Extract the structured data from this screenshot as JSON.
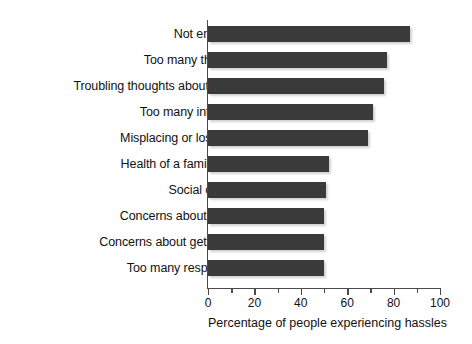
{
  "chart_data": {
    "type": "bar",
    "orientation": "horizontal",
    "title": "",
    "xlabel": "Percentage of people experiencing hassles",
    "ylabel": "",
    "xlim": [
      0,
      100
    ],
    "xticks": [
      0,
      20,
      40,
      60,
      80,
      100
    ],
    "xtick_labels": [
      "0",
      "20",
      "40",
      "60",
      "80",
      "100"
    ],
    "minor_tick_interval": 10,
    "grid": false,
    "legend": null,
    "bar_color": "#3a3a3a",
    "axis_color": "#4a4a4a",
    "background": "#ffffff",
    "categories": [
      "Not enough time",
      "Too many things to do",
      "Troubling thoughts about the future",
      "Too many interruptions",
      "Misplacing or losing things",
      "Health of a family member",
      "Social obligations",
      "Concerns about standards",
      "Concerns about getting ahead",
      "Too many responsibilities"
    ],
    "values": [
      87,
      77,
      76,
      71,
      69,
      52,
      51,
      50,
      50,
      50
    ]
  }
}
